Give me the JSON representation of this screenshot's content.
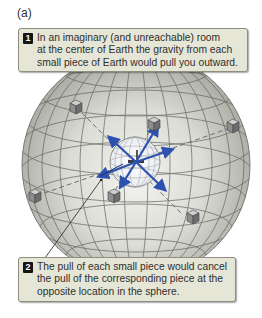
{
  "figure": {
    "panel_label": "(a)",
    "callouts": [
      {
        "number": "1",
        "lines": [
          "In an imaginary (and unreachable) room",
          "at the center of Earth the gravity from each",
          "small piece of Earth would pull you outward."
        ]
      },
      {
        "number": "2",
        "lines": [
          "The pull of each small piece would cancel",
          "the pull of the corresponding piece at the",
          "opposite location in the sphere."
        ]
      }
    ],
    "illustration": {
      "subject": "Earth sphere with latitude/longitude grid",
      "center_object": "small wireframe sphere (room) at Earth's center",
      "cube_count": 6,
      "arrow_count": 6,
      "colors": {
        "sphere_fill": "#d2d2cb",
        "grid_line": "#5c5c58",
        "arrow": "#2f52b0",
        "callout_bg": "#e5e6d6",
        "badge": "#151515"
      }
    }
  }
}
